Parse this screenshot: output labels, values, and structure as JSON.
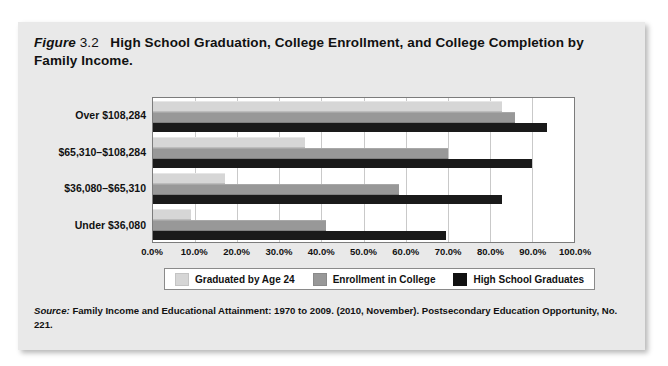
{
  "figure": {
    "label_word": "Figure",
    "number": "3.2",
    "caption": "High School Graduation, College Enrollment, and College Completion by Family Income."
  },
  "source": {
    "label_word": "Source:",
    "text": " Family Income and Educational Attainment: 1970 to 2009. (2010, November). Postsecondary Education Opportunity, No. 221."
  },
  "legend": {
    "items": [
      {
        "label": "Graduated by Age 24",
        "color": "#d6d6d6"
      },
      {
        "label": "Enrollment in College",
        "color": "#989898"
      },
      {
        "label": "High School Graduates",
        "color": "#111111"
      }
    ]
  },
  "chart_data": {
    "type": "bar",
    "orientation": "horizontal",
    "title": "High School Graduation, College Enrollment, and College Completion by Family Income.",
    "xlabel": "",
    "ylabel": "",
    "xlim": [
      0,
      100
    ],
    "xticks": [
      0,
      10,
      20,
      30,
      40,
      50,
      60,
      70,
      80,
      90,
      100
    ],
    "xtick_labels": [
      "0.0%",
      "10.0%",
      "20.0%",
      "30.0%",
      "40.0%",
      "50.0%",
      "60.0%",
      "70.0%",
      "80.0%",
      "90.0%",
      "100.0%"
    ],
    "grid": true,
    "legend_position": "bottom",
    "categories": [
      "Over $108,284",
      "$65,310–$108,284",
      "$36,080–$65,310",
      "Under $36,080"
    ],
    "series": [
      {
        "name": "Graduated by Age 24",
        "color": "#d6d6d6",
        "values": [
          83.0,
          36.0,
          17.0,
          9.0
        ]
      },
      {
        "name": "Enrollment in College",
        "color": "#989898",
        "values": [
          86.0,
          70.0,
          58.5,
          41.0
        ]
      },
      {
        "name": "High School Graduates",
        "color": "#1a1a1a",
        "values": [
          93.5,
          90.0,
          83.0,
          69.5
        ]
      }
    ]
  }
}
